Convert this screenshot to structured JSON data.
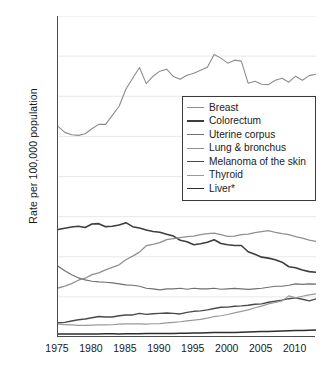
{
  "chart_data": {
    "type": "line",
    "title": "",
    "xlabel": "",
    "ylabel": "Rate per 100,000 population",
    "xlim": [
      1975,
      2013
    ],
    "ylim": [
      0,
      160
    ],
    "ytick_labels": [
      "0",
      "20",
      "40",
      "60",
      "80",
      "100",
      "120",
      "140",
      "160"
    ],
    "ytick_values": [
      0,
      20,
      40,
      60,
      80,
      100,
      120,
      140,
      160
    ],
    "xtick_labels": [
      "1975",
      "1980",
      "1985",
      "1990",
      "1995",
      "2000",
      "2005",
      "2010"
    ],
    "xtick_values": [
      1975,
      1980,
      1985,
      1990,
      1995,
      2000,
      2005,
      2010
    ],
    "minor_xticks": "every year 1975-2013",
    "grid": "horizontal faint gridlines at each major y tick",
    "legend_position": "center-right inside plot, boxed",
    "x": [
      1975,
      1976,
      1977,
      1978,
      1979,
      1980,
      1981,
      1982,
      1983,
      1984,
      1985,
      1986,
      1987,
      1988,
      1989,
      1990,
      1991,
      1992,
      1993,
      1994,
      1995,
      1996,
      1997,
      1998,
      1999,
      2000,
      2001,
      2002,
      2003,
      2004,
      2005,
      2006,
      2007,
      2008,
      2009,
      2010,
      2011,
      2012,
      2013
    ],
    "series": [
      {
        "name": "Breast",
        "color": "#8c8c8c",
        "width": 1.1,
        "values": [
          105.0,
          102.0,
          100.8,
          100.5,
          101.3,
          103.8,
          106.0,
          106.0,
          110.5,
          115.0,
          123.5,
          129.0,
          134.3,
          126.3,
          130.0,
          132.5,
          133.5,
          129.8,
          128.5,
          130.5,
          131.5,
          133.0,
          134.5,
          140.8,
          139.0,
          136.5,
          138.0,
          137.5,
          126.5,
          127.5,
          126.0,
          125.8,
          128.0,
          129.0,
          127.0,
          130.0,
          128.0,
          130.3,
          131.0
        ]
      },
      {
        "name": "Colorectum",
        "color": "#3d3d3d",
        "width": 1.6,
        "values": [
          53.6,
          54.2,
          54.8,
          55.2,
          54.6,
          56.3,
          56.5,
          55.0,
          55.2,
          55.8,
          57.0,
          55.0,
          54.3,
          53.3,
          52.6,
          52.2,
          51.2,
          50.3,
          48.2,
          47.5,
          46.0,
          46.5,
          47.2,
          48.5,
          46.6,
          46.0,
          45.6,
          45.6,
          42.5,
          41.2,
          39.8,
          39.3,
          38.5,
          37.3,
          35.0,
          34.5,
          33.4,
          32.6,
          32.3
        ]
      },
      {
        "name": "Uterine corpus",
        "color": "#707070",
        "width": 1.2,
        "values": [
          35.3,
          33.0,
          31.0,
          29.5,
          28.5,
          27.8,
          27.5,
          27.3,
          27.0,
          26.5,
          26.0,
          25.8,
          25.3,
          24.3,
          24.0,
          23.5,
          24.0,
          24.0,
          24.3,
          23.8,
          24.3,
          24.0,
          24.0,
          24.3,
          23.8,
          24.0,
          24.2,
          24.0,
          23.7,
          24.0,
          24.3,
          24.8,
          25.3,
          25.3,
          25.8,
          26.5,
          26.2,
          26.5,
          26.4
        ]
      },
      {
        "name": "Lung & bronchus",
        "color": "#909090",
        "width": 1.3,
        "values": [
          24.4,
          25.4,
          26.6,
          28.3,
          29.3,
          31.1,
          32.0,
          33.5,
          34.7,
          36.0,
          38.5,
          40.3,
          42.3,
          45.5,
          46.2,
          47.0,
          48.5,
          49.0,
          49.5,
          50.0,
          50.3,
          51.0,
          51.5,
          51.8,
          51.0,
          50.2,
          50.3,
          51.0,
          51.3,
          52.0,
          52.5,
          53.0,
          52.2,
          51.5,
          51.0,
          50.0,
          49.3,
          48.3,
          47.7
        ]
      },
      {
        "name": "Melanoma of the skin",
        "color": "#4a4a4a",
        "width": 1.4,
        "values": [
          7.1,
          7.3,
          8.0,
          8.6,
          9.0,
          9.6,
          10.2,
          10.0,
          10.0,
          10.6,
          11.0,
          11.0,
          11.8,
          11.3,
          11.6,
          11.8,
          12.0,
          11.8,
          11.5,
          12.3,
          12.8,
          13.0,
          13.5,
          14.2,
          14.8,
          14.9,
          15.3,
          15.5,
          15.8,
          16.3,
          16.5,
          17.3,
          17.8,
          18.4,
          19.1,
          19.5,
          18.8,
          18.0,
          19.0
        ]
      },
      {
        "name": "Thyroid",
        "color": "#9a9a9a",
        "width": 1.2,
        "values": [
          6.4,
          6.2,
          6.0,
          5.8,
          5.8,
          5.9,
          6.0,
          6.0,
          6.1,
          6.4,
          6.5,
          6.6,
          6.5,
          6.4,
          6.6,
          6.7,
          7.0,
          7.3,
          7.6,
          8.0,
          8.4,
          8.8,
          9.4,
          10.2,
          10.6,
          11.2,
          12.0,
          12.8,
          13.5,
          14.6,
          15.4,
          16.5,
          17.2,
          18.0,
          20.5,
          19.5,
          20.3,
          21.0,
          21.5
        ]
      },
      {
        "name": "Liver*",
        "color": "#2e2e2e",
        "width": 1.5,
        "values": [
          1.5,
          1.5,
          1.5,
          1.5,
          1.5,
          1.5,
          1.5,
          1.6,
          1.6,
          1.5,
          1.6,
          1.6,
          1.6,
          1.7,
          1.7,
          1.7,
          1.8,
          1.8,
          1.9,
          1.9,
          2.0,
          2.0,
          2.1,
          2.2,
          2.2,
          2.3,
          2.3,
          2.4,
          2.5,
          2.6,
          2.7,
          2.8,
          2.9,
          3.0,
          3.1,
          3.2,
          3.3,
          3.4,
          3.5
        ]
      }
    ]
  },
  "legend": {
    "items": [
      {
        "label": "Breast"
      },
      {
        "label": "Colorectum"
      },
      {
        "label": "Uterine corpus"
      },
      {
        "label": "Lung & bronchus"
      },
      {
        "label": "Melanoma of the skin"
      },
      {
        "label": "Thyroid"
      },
      {
        "label": "Liver*"
      }
    ]
  }
}
